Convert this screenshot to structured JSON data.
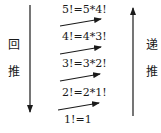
{
  "left_label": {
    "char1": "回",
    "char2": "推"
  },
  "right_label": {
    "char1": "递",
    "char2": "推"
  },
  "steps": [
    {
      "text": "5!=5*4!"
    },
    {
      "text": "4!=4*3!"
    },
    {
      "text": "3!=3*2!"
    },
    {
      "text": "2!=2*1!"
    },
    {
      "text": "1!=1"
    }
  ]
}
